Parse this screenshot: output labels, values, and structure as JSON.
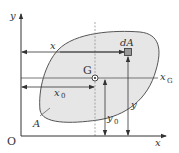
{
  "diagram": {
    "type": "centroid-of-area",
    "colors": {
      "line": "#333333",
      "shape_fill": "#e6e6e6",
      "shape_stroke": "#555555",
      "background": "#ffffff"
    },
    "labels": {
      "origin": "O",
      "y_axis": "y",
      "x_axis": "x",
      "centroid": "G",
      "element": "dA",
      "area": "A",
      "x_distance": "x",
      "x0_distance": "x",
      "x0_sub": "0",
      "xG_line": "x",
      "xG_sub": "G",
      "y_distance": "y",
      "y0_distance": "y",
      "y0_sub": "0"
    }
  }
}
